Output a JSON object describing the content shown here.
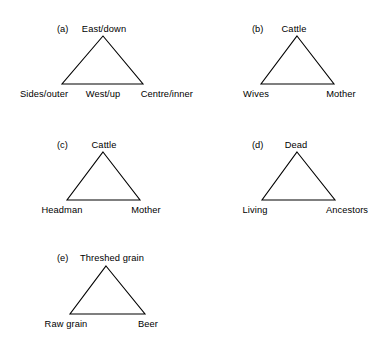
{
  "figure": {
    "background_color": "#ffffff",
    "line_color": "#000000",
    "text_color": "#000000",
    "panels": [
      {
        "tag": "(a)",
        "apex_label": "East/down",
        "bottom_left_label": "Sides/outer",
        "bottom_center_label": "West/up",
        "bottom_right_label": "Centre/inner"
      },
      {
        "tag": "(b)",
        "apex_label": "Cattle",
        "bottom_left_label": "Wives",
        "bottom_right_label": "Mother"
      },
      {
        "tag": "(c)",
        "apex_label": "Cattle",
        "bottom_left_label": "Headman",
        "bottom_right_label": "Mother"
      },
      {
        "tag": "(d)",
        "apex_label": "Dead",
        "bottom_left_label": "Living",
        "bottom_right_label": "Ancestors"
      },
      {
        "tag": "(e)",
        "apex_label": "Threshed grain",
        "bottom_left_label": "Raw grain",
        "bottom_right_label": "Beer"
      }
    ]
  }
}
